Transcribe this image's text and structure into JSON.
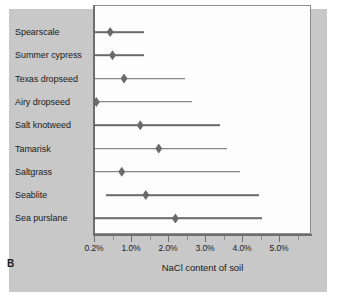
{
  "figure": {
    "panel_letter": "B",
    "background_color": "#c8c8c8",
    "plot_background_color": "#fdfdfd",
    "data_color": "#6a6a6a",
    "axis_color": "#6e6e6e"
  },
  "chart_data": {
    "type": "bar",
    "chart_subtype": "range-plot-with-marker",
    "title": "",
    "subtitle": "",
    "panel_letter": "B",
    "xlabel": "NaCl content of soil",
    "ylabel": "",
    "orientation": "horizontal",
    "grid": false,
    "legend": false,
    "legend_position": "none",
    "axis_scale": "non-linear (0.2% compressed, then linear 1.0%-5.0%)",
    "xlim": [
      0.2,
      5.5
    ],
    "xticks": [
      0.2,
      1.0,
      2.0,
      3.0,
      4.0,
      5.0
    ],
    "xticklabels": [
      "0.2%",
      "1.0%",
      "2.0%",
      "3.0%",
      "4.0%",
      "5.0%"
    ],
    "categories": [
      "Spearscale",
      "Summer cypress",
      "Texas dropseed",
      "Airy dropseed",
      "Salt knotweed",
      "Tamarisk",
      "Saltgrass",
      "Seablite",
      "Sea purslane"
    ],
    "series": [
      {
        "name": "NaCl tolerance range",
        "low": [
          0.2,
          0.2,
          0.2,
          0.2,
          0.2,
          0.2,
          0.2,
          0.45,
          0.2
        ],
        "high": [
          1.35,
          1.35,
          2.45,
          2.65,
          3.4,
          3.6,
          3.95,
          4.45,
          4.55
        ]
      },
      {
        "name": "Optimum NaCl content",
        "values": [
          0.55,
          0.6,
          0.85,
          0.25,
          1.25,
          1.75,
          0.8,
          1.4,
          2.2
        ]
      }
    ],
    "points": [
      {
        "category": "Spearscale",
        "low": 0.2,
        "optimum": 0.55,
        "high": 1.35
      },
      {
        "category": "Summer cypress",
        "low": 0.2,
        "optimum": 0.6,
        "high": 1.35
      },
      {
        "category": "Texas dropseed",
        "low": 0.2,
        "optimum": 0.85,
        "high": 2.45
      },
      {
        "category": "Airy dropseed",
        "low": 0.2,
        "optimum": 0.25,
        "high": 2.65
      },
      {
        "category": "Salt knotweed",
        "low": 0.2,
        "optimum": 1.25,
        "high": 3.4
      },
      {
        "category": "Tamarisk",
        "low": 0.2,
        "optimum": 1.75,
        "high": 3.6
      },
      {
        "category": "Saltgrass",
        "low": 0.2,
        "optimum": 0.8,
        "high": 3.95
      },
      {
        "category": "Seablite",
        "low": 0.45,
        "optimum": 1.4,
        "high": 4.45
      },
      {
        "category": "Sea purslane",
        "low": 0.2,
        "optimum": 2.2,
        "high": 4.55
      }
    ]
  }
}
